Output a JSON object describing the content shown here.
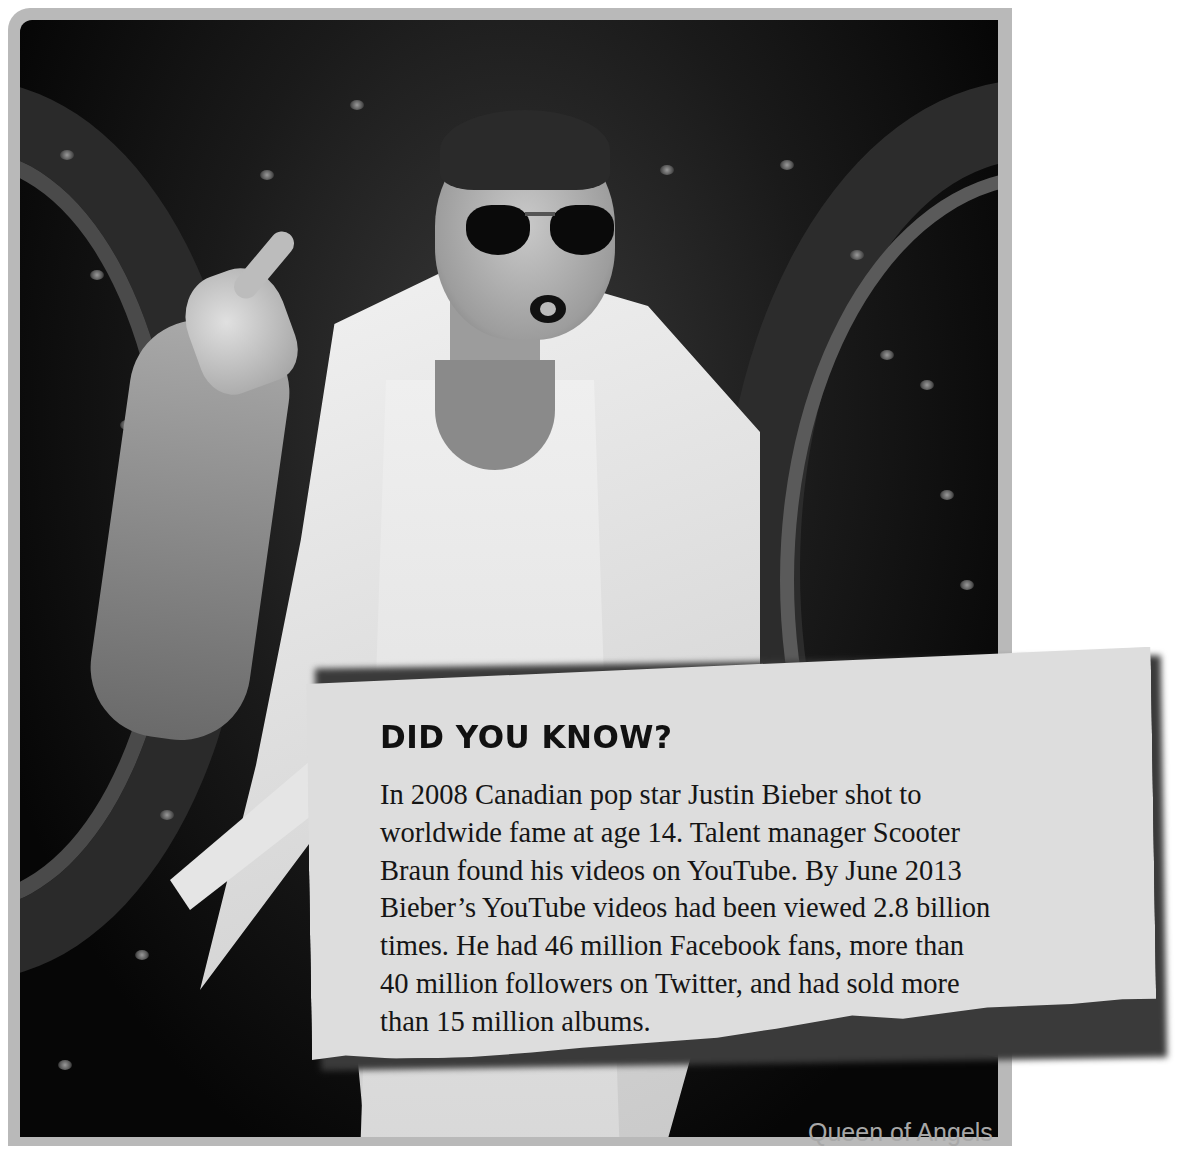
{
  "photo": {
    "subject": "performer-on-stage",
    "style": "black-and-white"
  },
  "callout": {
    "title": "DID YOU KNOW?",
    "lines": [
      "In 2008 Canadian pop star Justin Bieber shot to",
      "worldwide fame at age 14. Talent manager Scooter",
      "Braun found his videos on YouTube. By June 2013",
      "Bieber’s YouTube videos had been viewed 2.8 billion",
      "times. He had 46 million Facebook fans, more than",
      "40 million followers on Twitter, and had sold more",
      "than 15 million albums."
    ]
  },
  "caption": {
    "text": "Queen of Angels"
  },
  "colors": {
    "frame": "#b9b9b9",
    "note_paper": "#dddddd",
    "text": "#151515",
    "caption": "#a8a8a8"
  }
}
